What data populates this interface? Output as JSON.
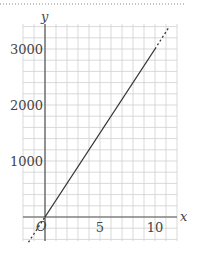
{
  "chart_data": {
    "type": "line",
    "title": "",
    "xlabel": "x",
    "ylabel": "y",
    "origin_label": "O",
    "x_ticks": [
      {
        "value": 5,
        "label": "5"
      },
      {
        "value": 10,
        "label": "10"
      }
    ],
    "y_ticks": [
      {
        "value": 1000,
        "label": "1000"
      },
      {
        "value": 2000,
        "label": "2000"
      },
      {
        "value": 3000,
        "label": "3000"
      }
    ],
    "xlim": [
      -2,
      12
    ],
    "ylim": [
      -400,
      3400
    ],
    "grid": true,
    "series": [
      {
        "name": "y = 300x",
        "equation": "y = 300x",
        "solid_segment": {
          "x": [
            0,
            10
          ],
          "y": [
            0,
            3000
          ]
        },
        "dashed_extensions": [
          {
            "x": [
              -1.5,
              0
            ],
            "y": [
              -450,
              0
            ]
          },
          {
            "x": [
              10,
              11.3
            ],
            "y": [
              3000,
              3400
            ]
          }
        ]
      }
    ],
    "colors": {
      "grid": "#cfcfcf",
      "axis": "#555555",
      "line": "#333333",
      "border_dots": "#888888"
    }
  }
}
